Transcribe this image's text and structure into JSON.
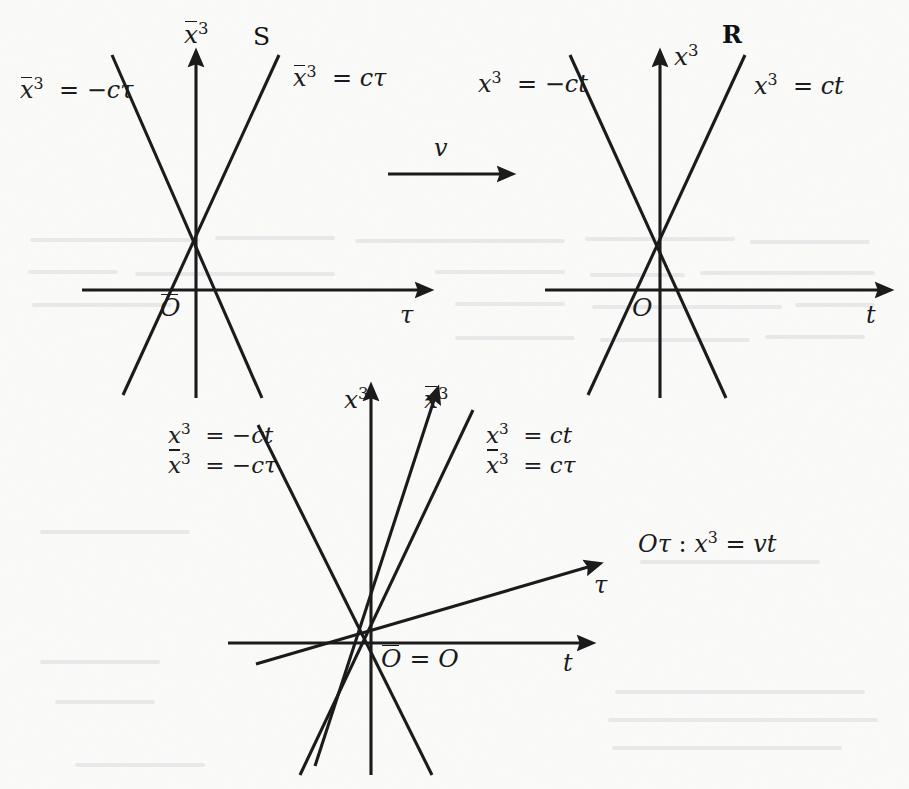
{
  "figure": {
    "type": "spacetime-diagram-set",
    "background_color": "#fbfbfa",
    "ink_color": "#1b1b1b",
    "panels": [
      {
        "id": "left",
        "frame_label": "S",
        "origin_label": "Ō",
        "vertical_axis_label": "x̅3",
        "horizontal_axis_label": "τ",
        "light_cone_left_label": "x̅3 = −cτ",
        "light_cone_right_label": "x̅3 = cτ"
      },
      {
        "id": "right",
        "frame_label": "R",
        "origin_label": "O",
        "vertical_axis_label": "x3",
        "horizontal_axis_label": "t",
        "light_cone_left_label": "x3 = −ct",
        "light_cone_right_label": "x3 = ct"
      },
      {
        "id": "bottom",
        "origin_label": "Ō = O",
        "vertical_axis_label": "x3",
        "tilted_vertical_axis_label": "x̅3",
        "horizontal_axis_label": "t",
        "tilted_horizontal_axis_label": "τ",
        "light_cone_left_label_line1": "x3 = −ct",
        "light_cone_left_label_line2": "x̅3 = −cτ",
        "light_cone_right_label_line1": "x3 = ct",
        "light_cone_right_label_line2": "x̅3 = cτ",
        "worldline_label": "Oτ : x3 = vt"
      }
    ],
    "boost_arrow": {
      "label": "v",
      "direction": "right"
    }
  },
  "labels": {
    "frame_S": "S",
    "frame_R": "R",
    "velocity": "v",
    "tau": "τ",
    "t": "t",
    "origin_bar": "O",
    "origin_plain": "O",
    "eq_minus": "=",
    "minus": "−",
    "c": "c",
    "v": "v",
    "x": "x",
    "three": "3",
    "colon": ":"
  }
}
